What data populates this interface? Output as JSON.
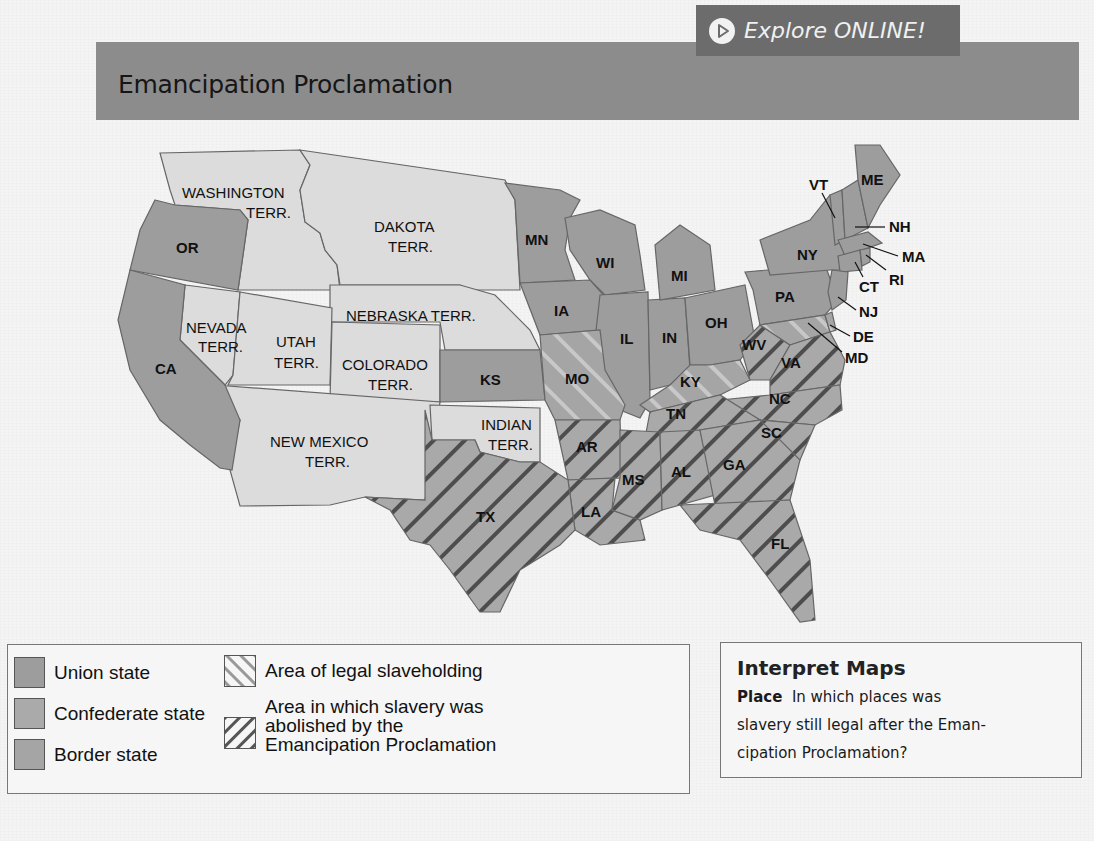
{
  "header": {
    "title": "Emancipation Proclamation",
    "explore_button": {
      "label": "Explore ONLINE!",
      "icon": "play-circle-icon"
    }
  },
  "colors": {
    "title_bar": "#8c8c8c",
    "explore_button": "#6c6c6c",
    "union_state": "#9d9d9d",
    "confederate_state": "#aaaaaa",
    "border_state": "#a5a5a5",
    "territory": "#dcdcdc",
    "hatch_line": "#555555",
    "legal_slavery_hatch": "#8a8a8a"
  },
  "map": {
    "union_states": [
      "OR",
      "CA",
      "KS",
      "MN",
      "IA",
      "WI",
      "IL",
      "IN",
      "MI",
      "OH",
      "PA",
      "NY",
      "VT",
      "ME",
      "NH",
      "MA",
      "RI",
      "CT",
      "NJ"
    ],
    "border_states": [
      "MO",
      "KY",
      "WV",
      "MD",
      "DE"
    ],
    "confederate_states": [
      "TX",
      "AR",
      "LA",
      "MS",
      "AL",
      "TN",
      "GA",
      "FL",
      "SC",
      "NC",
      "VA"
    ],
    "territories": [
      "WASHINGTON TERR.",
      "DAKOTA TERR.",
      "NEBRASKA TERR.",
      "NEVADA TERR.",
      "UTAH TERR.",
      "COLORADO TERR.",
      "NEW MEXICO TERR.",
      "INDIAN TERR."
    ],
    "labels": {
      "washington_1": "WASHINGTON",
      "washington_2": "TERR.",
      "dakota_1": "DAKOTA",
      "dakota_2": "TERR.",
      "nebraska": "NEBRASKA TERR.",
      "nevada_1": "NEVADA",
      "nevada_2": "TERR.",
      "utah_1": "UTAH",
      "utah_2": "TERR.",
      "colorado_1": "COLORADO",
      "colorado_2": "TERR.",
      "newmexico_1": "NEW MEXICO",
      "newmexico_2": "TERR.",
      "indian_1": "INDIAN",
      "indian_2": "TERR.",
      "OR": "OR",
      "CA": "CA",
      "KS": "KS",
      "MN": "MN",
      "IA": "IA",
      "WI": "WI",
      "IL": "IL",
      "IN": "IN",
      "MI": "MI",
      "OH": "OH",
      "PA": "PA",
      "NY": "NY",
      "VT": "VT",
      "ME": "ME",
      "NH": "NH",
      "MA": "MA",
      "RI": "RI",
      "CT": "CT",
      "NJ": "NJ",
      "DE": "DE",
      "MD": "MD",
      "MO": "MO",
      "KY": "KY",
      "WV": "WV",
      "VA": "VA",
      "NC": "NC",
      "SC": "SC",
      "TN": "TN",
      "AR": "AR",
      "MS": "MS",
      "AL": "AL",
      "GA": "GA",
      "LA": "LA",
      "TX": "TX",
      "FL": "FL"
    }
  },
  "legend": {
    "items": [
      {
        "label": "Union state",
        "swatch": "solid"
      },
      {
        "label": "Confederate state",
        "swatch": "solid"
      },
      {
        "label": "Border state",
        "swatch": "solid"
      },
      {
        "label": "Area of legal slaveholding",
        "swatch": "light-hatch"
      },
      {
        "label_lines": [
          "Area in which slavery was",
          "abolished by the",
          "Emancipation Proclamation"
        ],
        "swatch": "dark-hatch"
      }
    ]
  },
  "interpret": {
    "heading": "Interpret Maps",
    "prompt_label": "Place",
    "question_lines": [
      "In which places was",
      "slavery still legal after the Eman-",
      "cipation Proclamation?"
    ]
  }
}
